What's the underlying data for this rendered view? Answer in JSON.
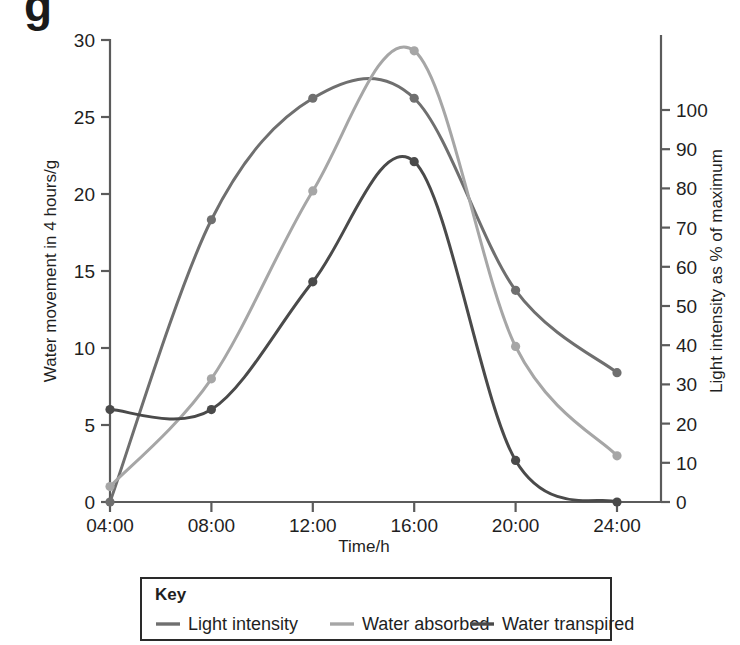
{
  "figure": {
    "partial_top_glyph": "g"
  },
  "chart_data": {
    "type": "line",
    "title": "",
    "xlabel": "Time/h",
    "ylabel": "Water movement in 4 hours/g",
    "y2label": "Light intensity as % of maximum",
    "categories": [
      "04:00",
      "08:00",
      "12:00",
      "16:00",
      "20:00",
      "24:00"
    ],
    "x": [
      4,
      8,
      12,
      16,
      20,
      24
    ],
    "xlim": [
      4,
      24
    ],
    "ylim": [
      0,
      30
    ],
    "y2lim": [
      0,
      100
    ],
    "yticks": [
      0,
      5,
      10,
      15,
      20,
      25,
      30
    ],
    "ytick_labels": [
      "0",
      "5",
      "10",
      "15",
      "20",
      "25",
      "30"
    ],
    "y2ticks": [
      0,
      10,
      20,
      30,
      40,
      50,
      60,
      70,
      80,
      90,
      100
    ],
    "y2tick_labels": [
      "0",
      "10",
      "20",
      "30",
      "40",
      "50",
      "60",
      "70",
      "80",
      "90",
      "100"
    ],
    "xtick_labels": [
      "04:00",
      "08:00",
      "12:00",
      "16:00",
      "20:00",
      "24:00"
    ],
    "grid": false,
    "legend_position": "below-plot",
    "markers": true,
    "series": [
      {
        "name": "Light intensity",
        "axis": "right",
        "color": "#6f6f6f",
        "values": [
          0.0,
          17.6,
          25.2,
          25.1,
          13.2,
          8.0
        ],
        "values_right_axis_percent": [
          0,
          72,
          103,
          103,
          54,
          33
        ]
      },
      {
        "name": "Water absorbed",
        "axis": "left",
        "color": "#a6a6a6",
        "values": [
          1.0,
          8.0,
          20.2,
          29.3,
          10.1,
          3.0
        ]
      },
      {
        "name": "Water transpired",
        "axis": "left",
        "color": "#4a4a4a",
        "values": [
          6.0,
          6.0,
          14.3,
          22.1,
          2.7,
          0.0
        ]
      }
    ]
  },
  "legend": {
    "title": "Key",
    "items": [
      {
        "label": "Light intensity",
        "color": "#6f6f6f"
      },
      {
        "label": "Water absorbed",
        "color": "#a6a6a6"
      },
      {
        "label": "Water transpired",
        "color": "#4a4a4a"
      }
    ]
  },
  "colors": {
    "light_intensity": "#6f6f6f",
    "water_absorbed": "#a6a6a6",
    "water_transpired": "#4a4a4a",
    "axis": "#5b5b5b",
    "text": "#1f1f1f"
  }
}
